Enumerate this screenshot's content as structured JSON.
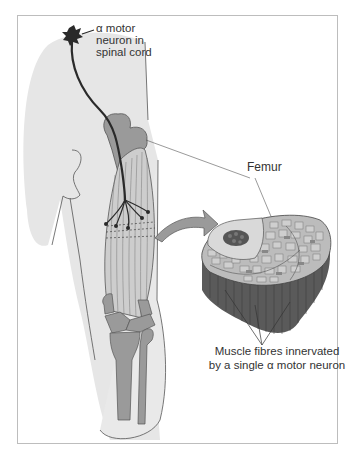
{
  "diagram": {
    "labels": {
      "neuron": {
        "line1": "α motor",
        "line2": "neuron in",
        "line3": "spinal cord"
      },
      "femur": "Femur",
      "fibres": {
        "line1": "Muscle fibres innervated",
        "line2": "by a single α motor neuron"
      }
    },
    "colors": {
      "skin": "#e6e6e6",
      "bone": "#9a9a9a",
      "muscle": "#c9c9c9",
      "nerve": "#2a2a2a",
      "frame": "#bdbdbd",
      "cross_section_side": "#5a5a5a"
    }
  }
}
